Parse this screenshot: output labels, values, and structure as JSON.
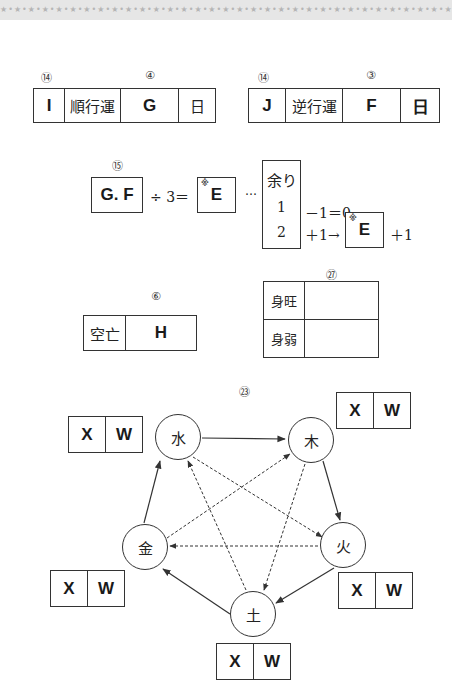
{
  "header": {
    "pattern": "★•★•★•★•★•★•★•★•★•★•★•★•★•★•★•★•★•★•★•★•★•★•★•★•★•★•★•★•★•★•★•★•★•★•★•★•★•★•★•★•★•★•★•★•★•★•★"
  },
  "fortune_table_forward": {
    "labels": {
      "left": "⑭",
      "right": "④"
    },
    "cells": [
      "I",
      "順行運",
      "G",
      "日"
    ]
  },
  "fortune_table_reverse": {
    "labels": {
      "left": "⑭",
      "right": "③"
    },
    "cells": [
      "J",
      "逆行運",
      "F",
      "日"
    ]
  },
  "division_formula": {
    "label": "⑮",
    "dividend": "G. F",
    "operator": "÷ 3＝",
    "quotient": "E",
    "quotient_mark": "※",
    "ellipsis": "…",
    "remainder_header": "余り",
    "remainder_values": [
      "1",
      "2"
    ],
    "rule_1": "－1＝0",
    "rule_2": "＋1→",
    "rule_2_result": "E",
    "rule_2_mark": "※",
    "rule_2_suffix": "＋1"
  },
  "void_table": {
    "label": "⑥",
    "header": "空亡",
    "value": "H"
  },
  "strength_table": {
    "label": "㉗",
    "rows": [
      {
        "label": "身旺",
        "value": ""
      },
      {
        "label": "身弱",
        "value": ""
      }
    ]
  },
  "five_elements": {
    "label": "㉓",
    "nodes": [
      {
        "id": "water",
        "char": "水",
        "x": "X",
        "w": "W"
      },
      {
        "id": "wood",
        "char": "木",
        "x": "X",
        "w": "W"
      },
      {
        "id": "fire",
        "char": "火",
        "x": "X",
        "w": "W"
      },
      {
        "id": "earth",
        "char": "土",
        "x": "X",
        "w": "W"
      },
      {
        "id": "metal",
        "char": "金",
        "x": "X",
        "w": "W"
      }
    ],
    "generating_cycle": [
      "水→木",
      "木→火",
      "火→土",
      "土→金",
      "金→水"
    ],
    "controlling_cycle": [
      "水→火",
      "火→金",
      "金→木",
      "木→土",
      "土→水"
    ]
  }
}
